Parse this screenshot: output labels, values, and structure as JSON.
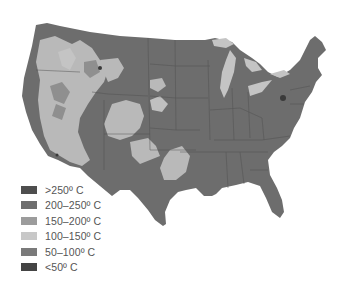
{
  "map": {
    "subject": "United States temperature ranges map",
    "colors": {
      "background": "#ffffff",
      "dominant": "#6d6d6d",
      "light": "#b8b8b8",
      "mid_light": "#9a9a9a",
      "dark": "#4a4a4a",
      "state_border": "#4f4f4f"
    }
  },
  "legend": {
    "items": [
      {
        "label": ">250º C",
        "color": "#4e4e4e"
      },
      {
        "label": "200–250º C",
        "color": "#6e6e6e"
      },
      {
        "label": "150–200º C",
        "color": "#9c9c9c"
      },
      {
        "label": "100–150º C",
        "color": "#c8c8c8"
      },
      {
        "label": "50–100º C",
        "color": "#7a7a7a"
      },
      {
        "label": "<50º C",
        "color": "#444444"
      }
    ]
  }
}
